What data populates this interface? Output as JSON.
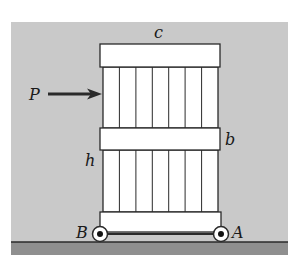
{
  "figure": {
    "type": "mechanics-diagram",
    "colors": {
      "background_panel": "#c9c9c9",
      "ground": "#8f8f8f",
      "box_fill": "#ffffff",
      "stroke": "#2a2a2a"
    },
    "labels": {
      "force": "P",
      "top_width": "c",
      "block_height": "b",
      "force_height": "h",
      "left_wheel": "B",
      "right_wheel": "A"
    },
    "slats_per_section": 7
  }
}
